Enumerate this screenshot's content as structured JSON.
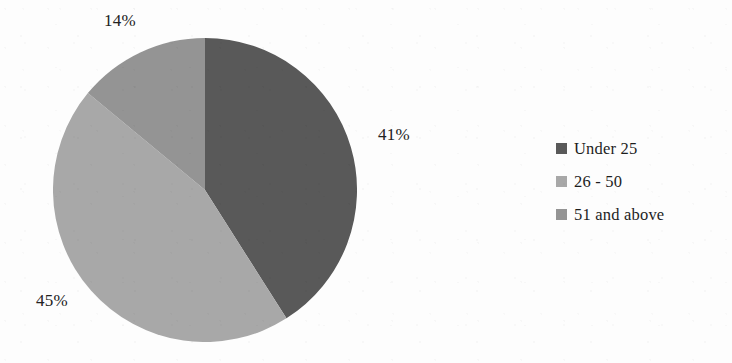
{
  "chart_data": {
    "type": "pie",
    "title": "",
    "subtitle": "",
    "xlabel": "",
    "ylabel": "",
    "legend_position": "right",
    "grid": false,
    "start_angle_deg": 0,
    "direction": "clockwise",
    "categories": [
      "Under 25",
      "26 - 50",
      "51 and above"
    ],
    "values": [
      41,
      45,
      14
    ],
    "value_unit": "%",
    "data_labels": [
      "41%",
      "45%",
      "14%"
    ],
    "colors": [
      "#595959",
      "#a8a8a8",
      "#949494"
    ],
    "slices": [
      {
        "label": "Under 25",
        "value": 41,
        "data_label": "41%",
        "color": "#595959",
        "start_deg": 0,
        "end_deg": 147.6
      },
      {
        "label": "26 - 50",
        "value": 45,
        "data_label": "45%",
        "color": "#a8a8a8",
        "start_deg": 147.6,
        "end_deg": 309.6
      },
      {
        "label": "51 and above",
        "value": 14,
        "data_label": "14%",
        "color": "#949494",
        "start_deg": 309.6,
        "end_deg": 360
      }
    ]
  },
  "labels": {
    "under_25": "41%",
    "age_26_50": "45%",
    "age_51_above": "14%"
  },
  "legend": {
    "items": [
      {
        "label": "Under 25",
        "color": "#595959",
        "swatch": "square-marker"
      },
      {
        "label": "26 - 50",
        "color": "#a8a8a8",
        "swatch": "square-marker"
      },
      {
        "label": "51 and above",
        "color": "#949494",
        "swatch": "square-marker"
      }
    ]
  },
  "colors": {
    "background": "#fdfdfd",
    "text": "#1b1b1b",
    "slice_dark": "#595959",
    "slice_light": "#a8a8a8",
    "slice_medium": "#949494"
  }
}
